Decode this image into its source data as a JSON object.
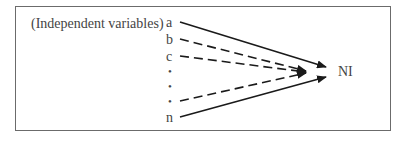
{
  "diagram": {
    "group_label": "(Independent variables)",
    "inputs": [
      {
        "label": "a",
        "style": "solid"
      },
      {
        "label": "b",
        "style": "dashed"
      },
      {
        "label": "c",
        "style": "dashed"
      },
      {
        "label": "•",
        "style": "none"
      },
      {
        "label": "•",
        "style": "none"
      },
      {
        "label": "•",
        "style": "dashed"
      },
      {
        "label": "n",
        "style": "solid"
      }
    ],
    "target": "NI",
    "colors": {
      "line": "#1a1a1a",
      "text": "#444444",
      "border": "#6b6b6b"
    }
  }
}
